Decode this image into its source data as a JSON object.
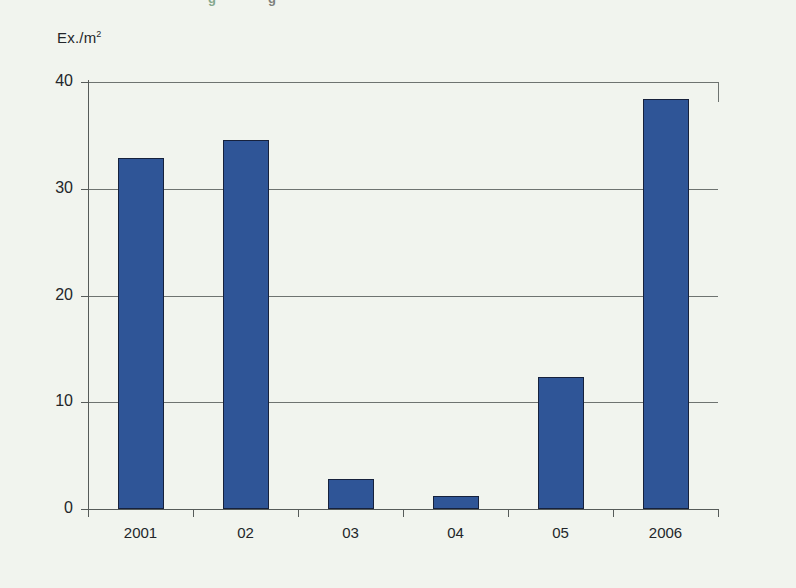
{
  "page": {
    "background_color": "#f1f4ee",
    "cut_off_heading_fragments": [
      "g",
      "g"
    ]
  },
  "chart_data": {
    "type": "bar",
    "title": "",
    "xlabel": "",
    "ylabel": "Ex./m",
    "ylabel_superscript": "2",
    "categories": [
      "2001",
      "02",
      "03",
      "04",
      "05",
      "2006"
    ],
    "values": [
      32.9,
      34.6,
      2.8,
      1.2,
      12.4,
      38.4
    ],
    "ylim": [
      0,
      40
    ],
    "yticks": [
      0,
      10,
      20,
      30,
      40
    ],
    "ytick_labels": [
      "0",
      "10",
      "20",
      "30",
      "40"
    ],
    "grid": true,
    "legend": "none",
    "series": [
      {
        "name": "Ex./m2",
        "values": [
          32.9,
          34.6,
          2.8,
          1.2,
          12.4,
          38.4
        ],
        "bar_color": "#2f5597",
        "bar_edge_color": "#16213c"
      }
    ]
  }
}
